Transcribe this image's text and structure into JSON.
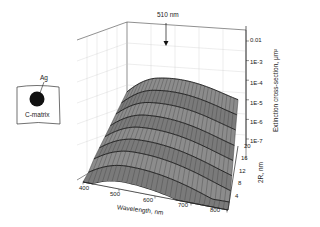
{
  "chart_data": {
    "type": "surface3d",
    "title": "",
    "annotation": {
      "text": "510 nm",
      "points_to": "peak wavelength"
    },
    "x_axis": {
      "label": "Wavelength, nm",
      "ticks": [
        "400",
        "500",
        "600",
        "700",
        "800"
      ],
      "range": [
        400,
        800
      ]
    },
    "y_axis": {
      "label": "2R, nm",
      "ticks": [
        "4",
        "8",
        "12",
        "16",
        "20"
      ],
      "range": [
        4,
        20
      ]
    },
    "z_axis": {
      "label": "Extinction cross-section, μm²",
      "scale": "log",
      "ticks": [
        "1E-7",
        "1E-6",
        "1E-5",
        "1E-4",
        "1E-3",
        "0.01"
      ],
      "range": [
        1e-07,
        0.01
      ]
    },
    "peak_wavelength_nm": 510,
    "series": [
      {
        "name": "2R=4 nm",
        "peak": 2e-07
      },
      {
        "name": "2R=6 nm",
        "peak": 6e-07
      },
      {
        "name": "2R=8 nm",
        "peak": 1.5e-06
      },
      {
        "name": "2R=10 nm",
        "peak": 3e-06
      },
      {
        "name": "2R=12 nm",
        "peak": 6e-06
      },
      {
        "name": "2R=14 nm",
        "peak": 1.2e-05
      },
      {
        "name": "2R=16 nm",
        "peak": 2.5e-05
      },
      {
        "name": "2R=18 nm",
        "peak": 5e-05
      },
      {
        "name": "2R=20 nm",
        "peak": 0.0001
      }
    ],
    "grid": true
  },
  "inset": {
    "particle_label": "Ag",
    "matrix_label": "C-matrix"
  },
  "labels": {
    "peak_annotation": "510 nm",
    "x_title": "Wavelength, nm",
    "y_title": "2R, nm",
    "z_title": "Extinction cross-section, μm²",
    "x_ticks": [
      "400",
      "500",
      "600",
      "700",
      "800"
    ],
    "y_ticks": [
      "4",
      "8",
      "12",
      "16",
      "20"
    ],
    "z_ticks": [
      "0.01",
      "1E-3",
      "1E-4",
      "1E-5",
      "1E-6",
      "1E-7"
    ]
  }
}
